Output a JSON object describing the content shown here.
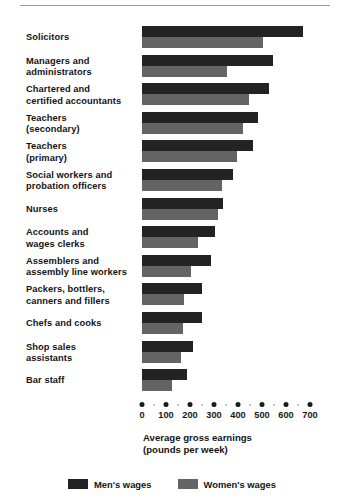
{
  "chart_data": {
    "type": "bar",
    "orientation": "horizontal",
    "title": "",
    "xlabel": "Average gross earnings\n(pounds per week)",
    "xlabel_line1": "Average gross earnings",
    "xlabel_line2": "(pounds per week)",
    "ylabel": "",
    "xlim": [
      0,
      700
    ],
    "xticks": [
      0,
      100,
      200,
      300,
      400,
      500,
      600,
      700
    ],
    "xticklabels": [
      "0",
      "100",
      "200",
      "300",
      "400",
      "500",
      "600",
      "700"
    ],
    "grid": false,
    "legend_position": "bottom",
    "categories": [
      "Solicitors",
      "Managers and administrators",
      "Chartered and certified accountants",
      "Teachers (secondary)",
      "Teachers (primary)",
      "Social workers and probation officers",
      "Nurses",
      "Accounts and wages clerks",
      "Assemblers and assembly line workers",
      "Packers, bottlers, canners and fillers",
      "Chefs and cooks",
      "Shop sales assistants",
      "Bar staff"
    ],
    "category_lines": [
      [
        "Solicitors"
      ],
      [
        "Managers and",
        "administrators"
      ],
      [
        "Chartered and",
        "certified accountants"
      ],
      [
        "Teachers",
        "(secondary)"
      ],
      [
        "Teachers",
        "(primary)"
      ],
      [
        "Social workers and",
        "probation officers"
      ],
      [
        "Nurses"
      ],
      [
        "Accounts and",
        "wages clerks"
      ],
      [
        "Assemblers and",
        "assembly line workers"
      ],
      [
        "Packers, bottlers,",
        "canners and fillers"
      ],
      [
        "Chefs and cooks"
      ],
      [
        "Shop sales",
        "assistants"
      ],
      [
        "Bar staff"
      ]
    ],
    "series": [
      {
        "name": "Men's wages",
        "color": "#232323",
        "values": [
          670,
          545,
          530,
          483,
          463,
          379,
          338,
          304,
          288,
          250,
          250,
          212,
          188
        ]
      },
      {
        "name": "Women's wages",
        "color": "#646464",
        "values": [
          505,
          355,
          445,
          420,
          396,
          333,
          317,
          233,
          204,
          175,
          171,
          163,
          125
        ]
      }
    ]
  },
  "legend": {
    "items": [
      {
        "label": "Men's wages",
        "color": "#232323"
      },
      {
        "label": "Women's wages",
        "color": "#646464"
      }
    ]
  }
}
